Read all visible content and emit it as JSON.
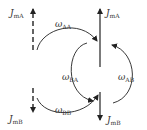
{
  "diagram": {
    "labels": {
      "j_ma_left": {
        "base": "J",
        "sub": "mA"
      },
      "j_ma_right": {
        "base": "J",
        "sub": "mA"
      },
      "j_mb_left": {
        "base": "J",
        "sub": "mB"
      },
      "j_mb_right": {
        "base": "J",
        "sub": "mB"
      },
      "omega_aa": {
        "base": "ω",
        "sub": "AA"
      },
      "omega_ba": {
        "base": "ω",
        "sub": "BA"
      },
      "omega_ab": {
        "base": "ω",
        "sub": "AB"
      },
      "omega_bb": {
        "base": "ω",
        "sub": "BB"
      }
    },
    "colors": {
      "stroke": "#222222",
      "text": "#333333"
    }
  }
}
